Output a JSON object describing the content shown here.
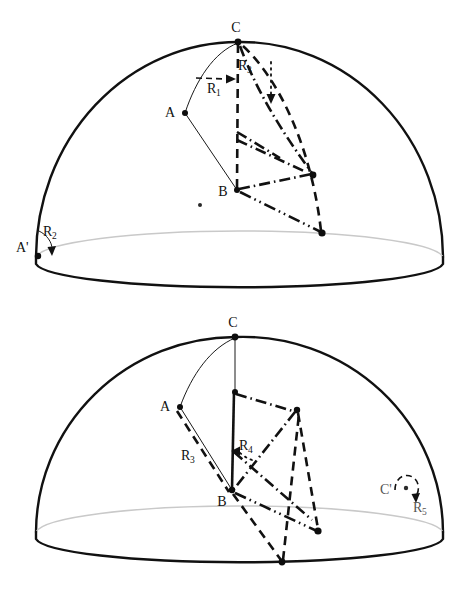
{
  "figure": {
    "panel_count": 2,
    "background_color": "#ffffff",
    "stroke_color": "#111111",
    "rim_back_color": "#c9c9c9"
  },
  "panels": [
    {
      "id": "top",
      "name": "top-panel",
      "dome": {
        "apex": [
          238,
          42
        ],
        "base_left": [
          36,
          257
        ],
        "base_right": [
          443,
          257
        ],
        "rim_center_y": 257,
        "rim_ry": 28,
        "base_bottom_y": 285
      },
      "points": [
        {
          "name": "C",
          "label": "C",
          "x": 238,
          "y": 42,
          "label_dx": -2,
          "label_dy": -10
        },
        {
          "name": "A",
          "label": "A",
          "x": 185,
          "y": 113,
          "label_dx": -15,
          "label_dy": 4
        },
        {
          "name": "B",
          "label": "B",
          "x": 237,
          "y": 190,
          "label_dx": -14,
          "label_dy": 6
        },
        {
          "name": "A-prime",
          "label": "A'",
          "x": 38,
          "y": 256,
          "label_dx": -22,
          "label_dy": -4
        },
        {
          "name": "endpoint-upper-right",
          "label": "",
          "x": 313,
          "y": 175,
          "label_dx": 0,
          "label_dy": 0
        },
        {
          "name": "endpoint-rim-right",
          "label": "",
          "x": 322,
          "y": 233,
          "label_dx": 0,
          "label_dy": 0
        },
        {
          "name": "stray-dot",
          "label": "",
          "x": 200,
          "y": 205,
          "label_dx": 0,
          "label_dy": 0
        }
      ],
      "labels": [
        {
          "name": "label-R1",
          "base": "R",
          "sub": "1",
          "x": 214,
          "y": 89
        },
        {
          "name": "label-R3",
          "base": "R",
          "sub": "3",
          "x": 243,
          "y": 67
        },
        {
          "name": "label-R2",
          "base": "R",
          "sub": "2",
          "x": 48,
          "y": 233
        }
      ],
      "arrows": [
        {
          "name": "arrow-R1",
          "kind": "straight-dashed",
          "from": [
            196,
            78
          ],
          "to": [
            234,
            79
          ]
        },
        {
          "name": "arrow-R3",
          "kind": "straight-dotted",
          "from": [
            271,
            62
          ],
          "to": [
            271,
            100
          ]
        },
        {
          "name": "arrow-R2",
          "kind": "curved",
          "from": [
            42,
            232
          ],
          "to": [
            50,
            252
          ]
        }
      ]
    },
    {
      "id": "bottom",
      "name": "bottom-panel",
      "dome": {
        "apex": [
          235,
          33
        ],
        "base_left": [
          36,
          228
        ],
        "base_right": [
          443,
          228
        ],
        "rim_center_y": 228,
        "rim_ry": 28,
        "base_bottom_y": 256
      },
      "points": [
        {
          "name": "C",
          "label": "C",
          "x": 235,
          "y": 33,
          "label_dx": -2,
          "label_dy": -9
        },
        {
          "name": "A",
          "label": "A",
          "x": 180,
          "y": 103,
          "label_dx": -15,
          "label_dy": 3
        },
        {
          "name": "B",
          "label": "B",
          "x": 232,
          "y": 186,
          "label_dx": -14,
          "label_dy": 14
        },
        {
          "name": "C-prime",
          "label": "C'",
          "x": 409,
          "y": 188,
          "label_dx": -22,
          "label_dy": 4
        },
        {
          "name": "peak-right",
          "label": "",
          "x": 297,
          "y": 106,
          "label_dx": 0,
          "label_dy": 0
        },
        {
          "name": "endpoint-rim",
          "label": "",
          "x": 318,
          "y": 227,
          "label_dx": 0,
          "label_dy": 0
        },
        {
          "name": "endpoint-low",
          "label": "",
          "x": 282,
          "y": 258,
          "label_dx": 0,
          "label_dy": 0
        }
      ],
      "labels": [
        {
          "name": "label-R3",
          "base": "R",
          "sub": "3",
          "x": 188,
          "y": 152
        },
        {
          "name": "label-R4",
          "base": "R",
          "sub": "4",
          "x": 244,
          "y": 142
        },
        {
          "name": "label-R5",
          "base": "R",
          "sub": "5",
          "x": 419,
          "y": 204
        }
      ],
      "arrows": [
        {
          "name": "arrow-R4",
          "kind": "curved",
          "from": [
            248,
            152
          ],
          "to": [
            236,
            148
          ]
        },
        {
          "name": "arrow-R5",
          "kind": "curved-loop",
          "from": [
            398,
            176
          ],
          "to": [
            416,
            195
          ]
        }
      ]
    }
  ]
}
